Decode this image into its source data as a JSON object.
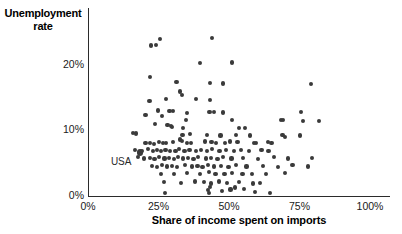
{
  "chart_data": {
    "type": "scatter",
    "title": "",
    "xlabel": "Share of income spent on imports",
    "ylabel": "Unemployment rate",
    "ylabel_line1": "Unemployment",
    "ylabel_line2": "rate",
    "xlim": [
      0,
      100
    ],
    "ylim": [
      0,
      26
    ],
    "grid": false,
    "legend": null,
    "xticks": [
      "0%",
      "25%",
      "50%",
      "75%",
      "100%"
    ],
    "xtick_values": [
      0,
      25,
      50,
      75,
      100
    ],
    "yticks": [
      "0%",
      "10%",
      "20%"
    ],
    "ytick_values": [
      0,
      10,
      20
    ],
    "annotations": [
      {
        "text": "USA",
        "x": 14.5,
        "y": 6.4,
        "points_to_x": 18.5,
        "points_to_y": 6.6
      }
    ],
    "highlighted_point": {
      "label": "USA",
      "x": 18.5,
      "y": 6.6
    },
    "point_color": "#3a3a3a",
    "axis_color": "#2b2b2b",
    "points": [
      [
        25.5,
        23.9
      ],
      [
        22.4,
        22.9
      ],
      [
        24.0,
        23.0
      ],
      [
        44.0,
        24.0
      ],
      [
        39.6,
        20.2
      ],
      [
        51.0,
        20.3
      ],
      [
        21.9,
        18.1
      ],
      [
        31.4,
        17.3
      ],
      [
        43.2,
        17.2
      ],
      [
        48.0,
        17.1
      ],
      [
        79.0,
        17.0
      ],
      [
        32.5,
        15.9
      ],
      [
        33.3,
        15.4
      ],
      [
        27.6,
        14.8
      ],
      [
        38.3,
        14.7
      ],
      [
        43.4,
        14.6
      ],
      [
        21.8,
        14.5
      ],
      [
        24.8,
        13.0
      ],
      [
        28.9,
        12.9
      ],
      [
        30.0,
        12.9
      ],
      [
        35.0,
        12.6
      ],
      [
        43.1,
        12.8
      ],
      [
        44.7,
        12.8
      ],
      [
        48.0,
        12.7
      ],
      [
        75.5,
        12.8
      ],
      [
        26.3,
        12.2
      ],
      [
        20.4,
        12.3
      ],
      [
        34.7,
        11.6
      ],
      [
        51.0,
        11.5
      ],
      [
        68.5,
        11.6
      ],
      [
        69.2,
        11.5
      ],
      [
        76.2,
        11.4
      ],
      [
        82.0,
        11.4
      ],
      [
        23.8,
        11.0
      ],
      [
        28.2,
        10.8
      ],
      [
        29.4,
        10.6
      ],
      [
        29.9,
        10.5
      ],
      [
        33.6,
        10.3
      ],
      [
        53.5,
        10.4
      ],
      [
        55.8,
        10.3
      ],
      [
        16.1,
        9.6
      ],
      [
        17.0,
        9.5
      ],
      [
        33.5,
        9.3
      ],
      [
        36.3,
        9.4
      ],
      [
        42.2,
        9.3
      ],
      [
        47.0,
        9.2
      ],
      [
        52.6,
        9.3
      ],
      [
        57.5,
        9.2
      ],
      [
        69.0,
        9.3
      ],
      [
        70.0,
        9.0
      ],
      [
        75.2,
        9.2
      ],
      [
        18.5,
        6.6
      ],
      [
        20.4,
        8.1
      ],
      [
        22.0,
        8.0
      ],
      [
        23.3,
        7.9
      ],
      [
        25.1,
        8.2
      ],
      [
        26.7,
        8.1
      ],
      [
        27.8,
        8.0
      ],
      [
        30.1,
        8.2
      ],
      [
        32.7,
        8.6
      ],
      [
        33.4,
        8.4
      ],
      [
        35.0,
        8.1
      ],
      [
        36.4,
        8.0
      ],
      [
        41.5,
        8.3
      ],
      [
        43.8,
        8.2
      ],
      [
        45.4,
        8.1
      ],
      [
        48.6,
        8.0
      ],
      [
        50.4,
        8.3
      ],
      [
        53.0,
        8.2
      ],
      [
        58.9,
        8.1
      ],
      [
        59.6,
        8.0
      ],
      [
        63.8,
        8.2
      ],
      [
        65.1,
        8.0
      ],
      [
        16.8,
        7.0
      ],
      [
        19.1,
        6.9
      ],
      [
        21.3,
        7.1
      ],
      [
        23.0,
        6.9
      ],
      [
        24.6,
        7.0
      ],
      [
        26.0,
        6.8
      ],
      [
        27.5,
        7.0
      ],
      [
        29.2,
        6.9
      ],
      [
        31.0,
        6.8
      ],
      [
        32.4,
        7.1
      ],
      [
        34.2,
        6.9
      ],
      [
        36.0,
        7.0
      ],
      [
        38.4,
        6.8
      ],
      [
        40.1,
        7.0
      ],
      [
        42.3,
        6.9
      ],
      [
        44.0,
        7.1
      ],
      [
        46.6,
        6.9
      ],
      [
        49.0,
        7.0
      ],
      [
        51.7,
        6.8
      ],
      [
        54.2,
        7.0
      ],
      [
        57.0,
        6.9
      ],
      [
        61.5,
        7.0
      ],
      [
        64.0,
        6.8
      ],
      [
        17.7,
        5.9
      ],
      [
        19.8,
        5.7
      ],
      [
        21.9,
        5.8
      ],
      [
        23.6,
        5.6
      ],
      [
        25.3,
        5.9
      ],
      [
        27.1,
        5.7
      ],
      [
        28.8,
        5.8
      ],
      [
        30.6,
        5.6
      ],
      [
        32.0,
        5.9
      ],
      [
        33.8,
        5.7
      ],
      [
        35.6,
        5.8
      ],
      [
        37.4,
        5.6
      ],
      [
        39.0,
        5.9
      ],
      [
        41.8,
        5.7
      ],
      [
        43.5,
        5.8
      ],
      [
        45.9,
        5.6
      ],
      [
        47.8,
        5.9
      ],
      [
        50.9,
        5.7
      ],
      [
        55.0,
        5.8
      ],
      [
        60.2,
        5.6
      ],
      [
        66.0,
        5.9
      ],
      [
        71.0,
        5.7
      ],
      [
        79.5,
        5.8
      ],
      [
        22.6,
        4.6
      ],
      [
        24.4,
        4.4
      ],
      [
        26.2,
        4.7
      ],
      [
        28.0,
        4.5
      ],
      [
        29.8,
        4.6
      ],
      [
        31.6,
        4.4
      ],
      [
        34.4,
        4.7
      ],
      [
        36.8,
        4.5
      ],
      [
        38.8,
        4.6
      ],
      [
        40.6,
        4.4
      ],
      [
        42.6,
        4.7
      ],
      [
        44.8,
        4.5
      ],
      [
        47.2,
        4.6
      ],
      [
        49.8,
        4.4
      ],
      [
        52.4,
        4.7
      ],
      [
        56.2,
        4.5
      ],
      [
        62.0,
        4.6
      ],
      [
        67.5,
        4.4
      ],
      [
        72.5,
        4.7
      ],
      [
        78.0,
        4.5
      ],
      [
        25.9,
        3.4
      ],
      [
        30.4,
        3.3
      ],
      [
        35.2,
        3.5
      ],
      [
        39.8,
        3.3
      ],
      [
        42.9,
        3.6
      ],
      [
        45.2,
        3.4
      ],
      [
        48.4,
        3.3
      ],
      [
        51.2,
        3.5
      ],
      [
        54.8,
        3.3
      ],
      [
        58.2,
        3.4
      ],
      [
        63.2,
        3.3
      ],
      [
        69.8,
        3.5
      ],
      [
        27.0,
        2.1
      ],
      [
        33.0,
        2.0
      ],
      [
        37.8,
        2.2
      ],
      [
        41.0,
        2.1
      ],
      [
        43.7,
        1.9
      ],
      [
        46.4,
        2.2
      ],
      [
        49.4,
        2.0
      ],
      [
        53.6,
        2.1
      ],
      [
        58.6,
        1.9
      ],
      [
        61.0,
        2.0
      ],
      [
        27.3,
        0.4
      ],
      [
        42.5,
        0.9
      ],
      [
        43.0,
        0.5
      ],
      [
        47.4,
        0.8
      ],
      [
        50.5,
        1.0
      ],
      [
        55.4,
        1.1
      ],
      [
        59.2,
        0.6
      ],
      [
        64.6,
        0.5
      ],
      [
        43.4,
        1.4
      ],
      [
        52.0,
        1.3
      ]
    ]
  },
  "icons": {
    "chart_type_icon": "scatter-plot-icon"
  }
}
